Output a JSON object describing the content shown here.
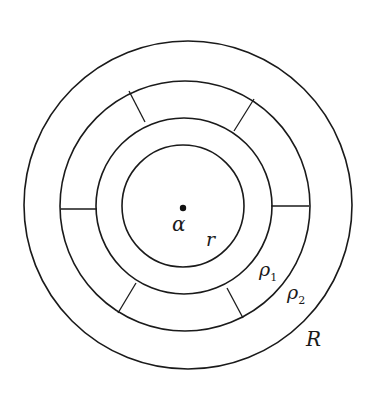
{
  "diagram": {
    "type": "concentric-annuli",
    "center": {
      "x": 184,
      "y": 206
    },
    "circles": [
      {
        "name": "r",
        "radius": 61
      },
      {
        "name": "rho1",
        "radius": 88
      },
      {
        "name": "rho2",
        "radius": 126
      },
      {
        "name": "R",
        "radius": 164
      }
    ],
    "labels": {
      "center": "α",
      "r": "r",
      "rho1": "ρ",
      "rho1_sub": "1",
      "rho2": "ρ",
      "rho2_sub": "2",
      "R": "R"
    },
    "spokes_between": [
      "rho1",
      "rho2"
    ],
    "spoke_angles_deg": [
      0,
      180,
      118,
      62,
      238,
      302
    ],
    "colors": {
      "stroke": "#1a1a1a",
      "background": "#ffffff"
    }
  }
}
